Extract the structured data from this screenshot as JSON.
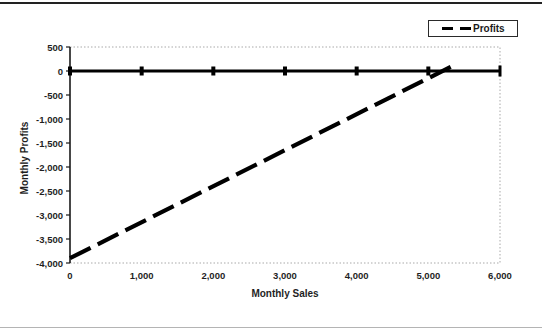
{
  "figure": {
    "background": "#ffffff",
    "top_rule_color": "#222222",
    "bottom_rule_color": "#b4b4b4"
  },
  "legend": {
    "label": "Profits",
    "sample_style": "dashed",
    "position": "top-right"
  },
  "chart_data": {
    "type": "line",
    "title": "",
    "xlabel": "Monthly Sales",
    "ylabel": "Monthly Profits",
    "xlim": [
      0,
      6000
    ],
    "ylim": [
      -4000,
      500
    ],
    "grid": false,
    "legend_position": "top-right",
    "x_tick_labels": [
      "0",
      "1,000",
      "2,000",
      "3,000",
      "4,000",
      "5,000",
      "6,000"
    ],
    "x_tick_values": [
      0,
      1000,
      2000,
      3000,
      4000,
      5000,
      6000
    ],
    "y_tick_labels": [
      "500",
      "0",
      "-500",
      "-1,000",
      "-1,500",
      "-2,000",
      "-2,500",
      "-3,000",
      "-3,500",
      "-4,000"
    ],
    "y_tick_values": [
      500,
      0,
      -500,
      -1000,
      -1500,
      -2000,
      -2500,
      -3000,
      -3500,
      -4000
    ],
    "series": [
      {
        "name": "Profits",
        "style": "dashed",
        "color": "#000000",
        "points": [
          [
            0,
            -3900
          ],
          [
            5400,
            150
          ]
        ]
      }
    ],
    "zero_line": {
      "y": 0,
      "style": "thick-solid",
      "marker": "square",
      "marker_x_values": [
        0,
        1000,
        2000,
        3000,
        4000,
        5000
      ],
      "end_cap_x": 6000
    },
    "colors": {
      "axis": "#1a1a1a",
      "plot_border": "#a9a9a9",
      "text": "#1f1f1f"
    }
  }
}
